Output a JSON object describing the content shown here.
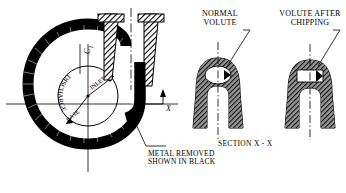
{
  "diagram": {
    "title_normal": "NORMAL\nVOLUTE",
    "title_chipping": "VOLUTE AFTER\nCHIPPING",
    "section_label": "SECTION X - X",
    "note": "METAL REMOVED\nSHOWN IN BLACK",
    "axis_x_label": "X",
    "axis_c1_label": "C",
    "axis_c1_sub": "1",
    "inner_curved_label": "DISCHARGE",
    "arrow_label_upper": "INLET",
    "arrow_label_lower": "BASE",
    "area_normal": "A",
    "area_normal_sub": "1",
    "area_chipped": "A",
    "area_chipped_sub": "2"
  },
  "colors": {
    "ink": "#000000",
    "fill_black": "#101010",
    "hatch": "#1a1a1a",
    "paper": "#ffffff"
  }
}
